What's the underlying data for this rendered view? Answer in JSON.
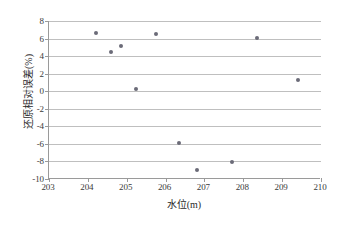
{
  "chart_data": {
    "type": "scatter",
    "title": "",
    "xlabel": "水位(m)",
    "ylabel": "还原相对误差(%)",
    "xlim": [
      203,
      210
    ],
    "ylim": [
      -10,
      8
    ],
    "xticks": [
      203,
      204,
      205,
      206,
      207,
      208,
      209,
      210
    ],
    "yticks": [
      8,
      6,
      4,
      2,
      0,
      -2,
      -4,
      -6,
      -8,
      -10
    ],
    "xtick_labels": [
      "203",
      "204",
      "205",
      "206",
      "207",
      "208",
      "209",
      "210"
    ],
    "ytick_labels": [
      "8",
      "6",
      "4",
      "2",
      "0",
      "-2",
      "-4",
      "-6",
      "-8",
      "-10"
    ],
    "grid": "horizontal",
    "legend": "none",
    "marker_color": "#6b6b78",
    "gridline_color": "#bfbfbf",
    "axis_color": "#9a9a9a",
    "series": [
      {
        "name": "还原相对误差",
        "points": [
          {
            "x": 204.2,
            "y": 6.65
          },
          {
            "x": 204.6,
            "y": 4.5
          },
          {
            "x": 204.85,
            "y": 5.2
          },
          {
            "x": 205.25,
            "y": 0.2
          },
          {
            "x": 205.75,
            "y": 6.5
          },
          {
            "x": 206.35,
            "y": -5.85
          },
          {
            "x": 206.8,
            "y": -9.0
          },
          {
            "x": 207.7,
            "y": -8.1
          },
          {
            "x": 208.35,
            "y": 6.05
          },
          {
            "x": 209.4,
            "y": 1.25
          }
        ]
      }
    ]
  }
}
